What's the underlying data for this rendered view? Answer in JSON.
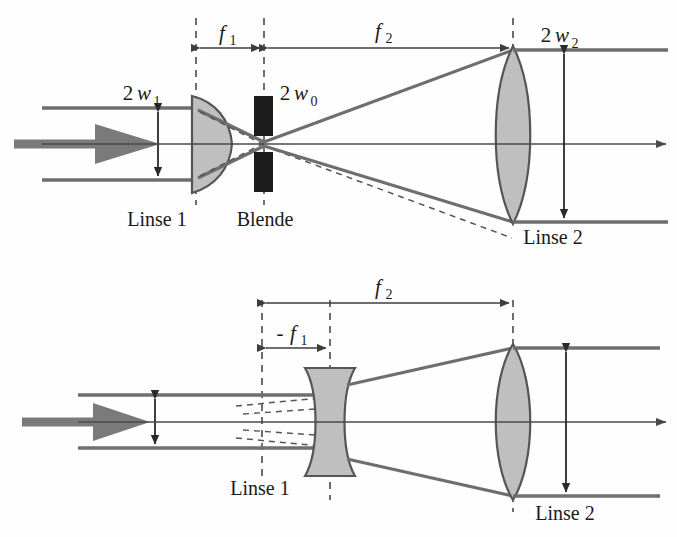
{
  "figure": {
    "background_color": "#fefefe",
    "ink_color": "#3d3d3d",
    "lens_fill_color": "#bfbfbf",
    "lens_stroke_color": "#555555",
    "aperture_color": "#1c1c1c",
    "beam_color": "#6e6e6e",
    "axis_color": "#4a4a4a"
  },
  "diagrams": [
    {
      "id": "keplerian",
      "name": "oberes-diagramm",
      "dimension_labels": [
        {
          "id": "f1",
          "base": "f",
          "sub": "1",
          "prefix": "",
          "italic": true,
          "meaning": "Brennweite Linse 1"
        },
        {
          "id": "f2",
          "base": "f",
          "sub": "2",
          "prefix": "",
          "italic": true,
          "meaning": "Brennweite Linse 2"
        }
      ],
      "beam_labels": [
        {
          "id": "2w1",
          "prefix": "2",
          "base": "w",
          "sub": "1",
          "meaning": "Eingangsstrahldurchmesser"
        },
        {
          "id": "2w0",
          "prefix": "2",
          "base": "w",
          "sub": "0",
          "meaning": "Taillendurchmesser in der Blende"
        },
        {
          "id": "2w2",
          "prefix": "2",
          "base": "w",
          "sub": "2",
          "meaning": "Ausgangsstrahldurchmesser"
        }
      ],
      "component_labels": [
        {
          "id": "linse1",
          "text": "Linse 1"
        },
        {
          "id": "blende",
          "text": "Blende"
        },
        {
          "id": "linse2",
          "text": "Linse 2"
        }
      ]
    },
    {
      "id": "galilean",
      "name": "unteres-diagramm",
      "dimension_labels": [
        {
          "id": "minus-f1",
          "base": "f",
          "sub": "1",
          "prefix": "-",
          "italic": true,
          "meaning": "negative Brennweite Zerstreuungslinse"
        },
        {
          "id": "f2",
          "base": "f",
          "sub": "2",
          "prefix": "",
          "italic": true,
          "meaning": "Brennweite Linse 2"
        }
      ],
      "beam_labels": [],
      "component_labels": [
        {
          "id": "linse1",
          "text": "Linse 1"
        },
        {
          "id": "linse2",
          "text": "Linse 2"
        }
      ]
    }
  ]
}
